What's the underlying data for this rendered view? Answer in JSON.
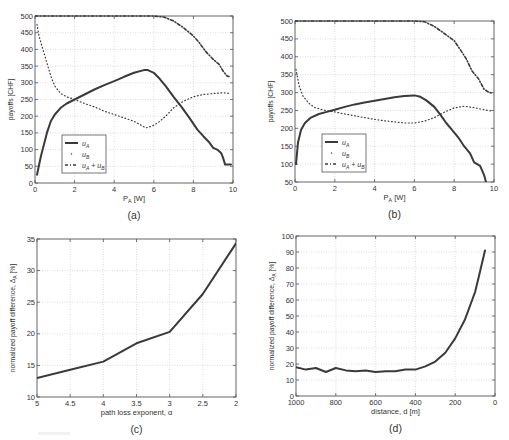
{
  "figure": {
    "colors": {
      "line": "#3a3a3a",
      "axis": "#555555",
      "grid": "#cfcfcf",
      "text": "#333333"
    }
  },
  "chart_data": [
    {
      "id": "a",
      "type": "line",
      "caption": "(a)",
      "title": "",
      "xlabel": "P_A [W]",
      "ylabel": "payoffs [CHF]",
      "xlim": [
        0,
        10
      ],
      "ylim": [
        0,
        500
      ],
      "xticks": [
        0,
        2,
        4,
        6,
        8,
        10
      ],
      "yticks": [
        0,
        50,
        100,
        150,
        200,
        250,
        300,
        350,
        400,
        450,
        500
      ],
      "grid": true,
      "reversed_x": false,
      "legend": {
        "position": "lower-left",
        "entries": [
          "u_A",
          "u_B",
          "u_A + u_B"
        ]
      },
      "box": {
        "left": 35,
        "top": 16,
        "right": 233,
        "bottom": 183
      },
      "series": [
        {
          "name": "u_A",
          "style": "solid",
          "x": [
            0.1,
            0.3,
            0.6,
            0.8,
            1.0,
            1.3,
            1.6,
            2.0,
            2.5,
            3.0,
            3.5,
            4.0,
            4.5,
            5.0,
            5.5,
            5.7,
            6.0,
            6.3,
            6.6,
            7.0,
            7.4,
            7.8,
            8.2,
            8.5,
            8.8,
            9.0,
            9.2,
            9.4,
            9.5,
            9.6,
            9.8,
            9.9
          ],
          "y": [
            25,
            80,
            150,
            185,
            205,
            225,
            238,
            250,
            265,
            280,
            293,
            305,
            318,
            330,
            338,
            338,
            330,
            312,
            290,
            258,
            228,
            195,
            160,
            140,
            122,
            105,
            100,
            90,
            75,
            55,
            55,
            55
          ]
        },
        {
          "name": "u_B",
          "style": "dotted",
          "x": [
            0.1,
            0.2,
            0.4,
            0.6,
            0.8,
            1.0,
            1.3,
            1.6,
            2.0,
            2.5,
            3.0,
            3.5,
            4.0,
            4.5,
            5.0,
            5.3,
            5.6,
            5.9,
            6.2,
            6.6,
            7.0,
            7.5,
            8.0,
            8.5,
            9.0,
            9.5,
            9.9
          ],
          "y": [
            475,
            440,
            400,
            360,
            320,
            290,
            268,
            258,
            250,
            238,
            228,
            215,
            205,
            195,
            185,
            175,
            165,
            170,
            180,
            200,
            225,
            245,
            258,
            265,
            268,
            270,
            268
          ]
        },
        {
          "name": "u_A + u_B",
          "style": "dashdot",
          "x": [
            0.0,
            1.0,
            2.0,
            3.0,
            4.0,
            5.0,
            6.0,
            6.5,
            7.0,
            7.5,
            8.0,
            8.3,
            8.6,
            9.0,
            9.3,
            9.5,
            9.7,
            9.9
          ],
          "y": [
            500,
            500,
            500,
            500,
            500,
            500,
            500,
            497,
            485,
            465,
            440,
            420,
            395,
            370,
            355,
            335,
            320,
            318
          ]
        }
      ]
    },
    {
      "id": "b",
      "type": "line",
      "caption": "(b)",
      "title": "",
      "xlabel": "P_A [W]",
      "ylabel": "payoffs [CHF]",
      "xlim": [
        0,
        10
      ],
      "ylim": [
        50,
        500
      ],
      "xticks": [
        0,
        2,
        4,
        6,
        8,
        10
      ],
      "yticks": [
        50,
        100,
        150,
        200,
        250,
        300,
        350,
        400,
        450,
        500
      ],
      "grid": true,
      "reversed_x": false,
      "legend": {
        "position": "lower-left",
        "entries": [
          "u_A",
          "u_B",
          "u_A + u_B"
        ]
      },
      "box": {
        "left": 295,
        "top": 21,
        "right": 494,
        "bottom": 182
      },
      "series": [
        {
          "name": "u_A",
          "style": "solid",
          "x": [
            0.05,
            0.15,
            0.3,
            0.5,
            0.8,
            1.2,
            1.6,
            2.0,
            2.5,
            3.0,
            3.5,
            4.0,
            4.5,
            5.0,
            5.5,
            6.0,
            6.3,
            6.6,
            7.0,
            7.3,
            7.6,
            7.9,
            8.2,
            8.5,
            8.8,
            9.0,
            9.3,
            9.5,
            9.6
          ],
          "y": [
            100,
            160,
            195,
            215,
            230,
            240,
            246,
            252,
            260,
            267,
            272,
            277,
            282,
            287,
            290,
            292,
            288,
            278,
            260,
            238,
            215,
            195,
            175,
            150,
            130,
            105,
            95,
            70,
            50
          ]
        },
        {
          "name": "u_B",
          "style": "dotted",
          "x": [
            0.05,
            0.2,
            0.4,
            0.7,
            1.0,
            1.5,
            2.0,
            2.5,
            3.0,
            3.5,
            4.0,
            4.5,
            5.0,
            5.5,
            6.0,
            6.5,
            7.0,
            7.5,
            8.0,
            8.5,
            9.0,
            9.5,
            9.9
          ],
          "y": [
            365,
            320,
            290,
            270,
            258,
            250,
            246,
            240,
            235,
            230,
            225,
            221,
            218,
            215,
            215,
            220,
            230,
            245,
            257,
            262,
            258,
            252,
            248
          ]
        },
        {
          "name": "u_A + u_B",
          "style": "dashdot",
          "x": [
            0.0,
            1.0,
            2.0,
            3.0,
            4.0,
            5.0,
            6.0,
            6.5,
            7.0,
            7.5,
            8.0,
            8.3,
            8.6,
            8.9,
            9.2,
            9.5,
            9.7,
            9.9
          ],
          "y": [
            500,
            500,
            500,
            500,
            500,
            500,
            500,
            498,
            485,
            465,
            445,
            420,
            395,
            360,
            340,
            310,
            302,
            298
          ]
        }
      ]
    },
    {
      "id": "c",
      "type": "line",
      "caption": "(c)",
      "title": "",
      "xlabel": "path loss exponent, α",
      "ylabel": "normalized payoff difference, Δ_A [%]",
      "xlim": [
        5,
        2
      ],
      "ylim": [
        10,
        35
      ],
      "xticks": [
        5,
        4.5,
        4,
        3.5,
        3,
        2.5,
        2
      ],
      "xticklabels": [
        "5",
        "4.5",
        "4",
        "3.5",
        "3",
        "2.5",
        "2"
      ],
      "yticks": [
        10,
        15,
        20,
        25,
        30,
        35
      ],
      "grid": true,
      "reversed_x": true,
      "box": {
        "left": 37,
        "top": 239,
        "right": 236,
        "bottom": 397
      },
      "series": [
        {
          "name": "Δ_A",
          "style": "solid",
          "x": [
            5,
            4.5,
            4,
            3.5,
            3,
            2.5,
            2
          ],
          "y": [
            13.0,
            14.3,
            15.6,
            18.5,
            20.3,
            26.3,
            34.3
          ]
        }
      ]
    },
    {
      "id": "d",
      "type": "line",
      "caption": "(d)",
      "title": "",
      "xlabel": "distance, d [m]",
      "ylabel": "normalized payoff difference, Δ_A [%]",
      "xlim": [
        1000,
        0
      ],
      "ylim": [
        0,
        100
      ],
      "xticks": [
        1000,
        800,
        600,
        400,
        200,
        0
      ],
      "yticks": [
        0,
        10,
        20,
        30,
        40,
        50,
        60,
        70,
        80,
        90,
        100
      ],
      "grid": true,
      "reversed_x": true,
      "box": {
        "left": 296,
        "top": 236,
        "right": 495,
        "bottom": 396
      },
      "series": [
        {
          "name": "Δ_A",
          "style": "solid",
          "x": [
            1000,
            950,
            900,
            850,
            800,
            750,
            700,
            650,
            600,
            550,
            500,
            450,
            400,
            350,
            300,
            250,
            200,
            150,
            100,
            75,
            50
          ],
          "y": [
            18,
            16.5,
            17.5,
            15,
            17.5,
            16,
            15.5,
            16,
            15,
            15.5,
            15.5,
            16.5,
            16.5,
            18.5,
            21.5,
            27,
            36,
            48,
            65,
            78,
            91
          ]
        }
      ]
    }
  ]
}
